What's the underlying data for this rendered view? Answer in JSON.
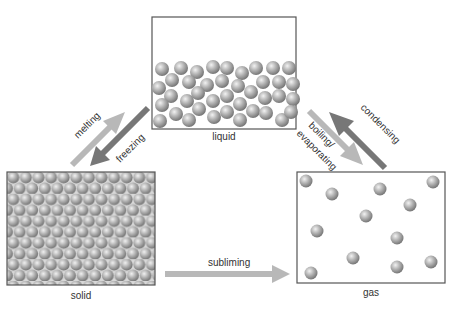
{
  "states": {
    "liquid": {
      "label": "liquid"
    },
    "solid": {
      "label": "solid"
    },
    "gas": {
      "label": "gas"
    }
  },
  "transitions": {
    "melting": "melting",
    "freezing": "freezing",
    "boiling_line1": "boiling/",
    "boiling_line2": "evaporating",
    "condensing": "condensing",
    "subliming": "subliming"
  },
  "colors": {
    "light_arrow": "#b8b8b8",
    "dark_arrow": "#777777",
    "box_border": "#555555",
    "particle": "#9a9a9a"
  }
}
